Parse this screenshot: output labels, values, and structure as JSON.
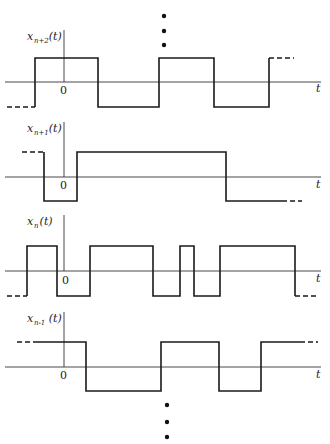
{
  "figure": {
    "axis_variable": "t",
    "origin_label": "0",
    "ellipsis_top": {
      "x": 164,
      "ys": [
        16,
        31,
        45
      ]
    },
    "ellipsis_bottom": {
      "x": 167,
      "ys": [
        405,
        422,
        437
      ]
    },
    "axis_x_start": 5,
    "axis_x_end": 321,
    "yaxis_x": 64
  },
  "chart_data": {
    "type": "line",
    "title": "",
    "xlabel": "t",
    "ylabel": "",
    "series": [
      {
        "name": "x_{n+2}(t)",
        "label_main": "x",
        "label_sub": "n+2",
        "label_tail": "(t)",
        "baseline_y": 82,
        "high_y": 58,
        "low_y": 107,
        "yaxis_top": 30,
        "start_level": "low",
        "lead_dash": [
          7,
          35
        ],
        "transitions_x": [
          35,
          98,
          159,
          214,
          269
        ],
        "trail_dash": [
          269,
          294
        ],
        "end_level": "high",
        "t_label_pos": [
          316,
          92
        ],
        "zero_label_pos": [
          60,
          94
        ]
      },
      {
        "name": "x_{n+1}(t)",
        "label_main": "x",
        "label_sub": "n+1",
        "label_tail": "(t)",
        "baseline_y": 177,
        "high_y": 152,
        "low_y": 201,
        "yaxis_top": 122,
        "start_level": "high",
        "lead_dash": [
          22,
          44
        ],
        "transitions_x": [
          44,
          77,
          226
        ],
        "trail_dash": [
          282,
          302
        ],
        "end_level": "low",
        "t_label_pos": [
          316,
          188
        ],
        "zero_label_pos": [
          60,
          189
        ]
      },
      {
        "name": "x_n(t)",
        "label_main": "x",
        "label_sub": "n",
        "label_tail": "(t)",
        "baseline_y": 271,
        "high_y": 246,
        "low_y": 296,
        "yaxis_top": 215,
        "start_level": "low",
        "lead_dash": [
          7,
          27
        ],
        "transitions_x": [
          27,
          57,
          90,
          153,
          180,
          194,
          220,
          295
        ],
        "trail_dash": [
          295,
          318
        ],
        "end_level": "low",
        "t_label_pos": [
          316,
          282
        ],
        "zero_label_pos": [
          62,
          284
        ]
      },
      {
        "name": "x_{n-1}(t)",
        "label_main": "x",
        "label_sub": "n-1",
        "label_tail": "(t)",
        "baseline_y": 367,
        "high_y": 342,
        "low_y": 391,
        "yaxis_top": 312,
        "start_level": "high",
        "lead_dash": [
          17,
          36
        ],
        "transitions_x": [
          86,
          161,
          219,
          261
        ],
        "trail_dash": [
          300,
          318
        ],
        "end_level": "high",
        "t_label_pos": [
          316,
          378
        ],
        "zero_label_pos": [
          60,
          379
        ]
      }
    ]
  }
}
